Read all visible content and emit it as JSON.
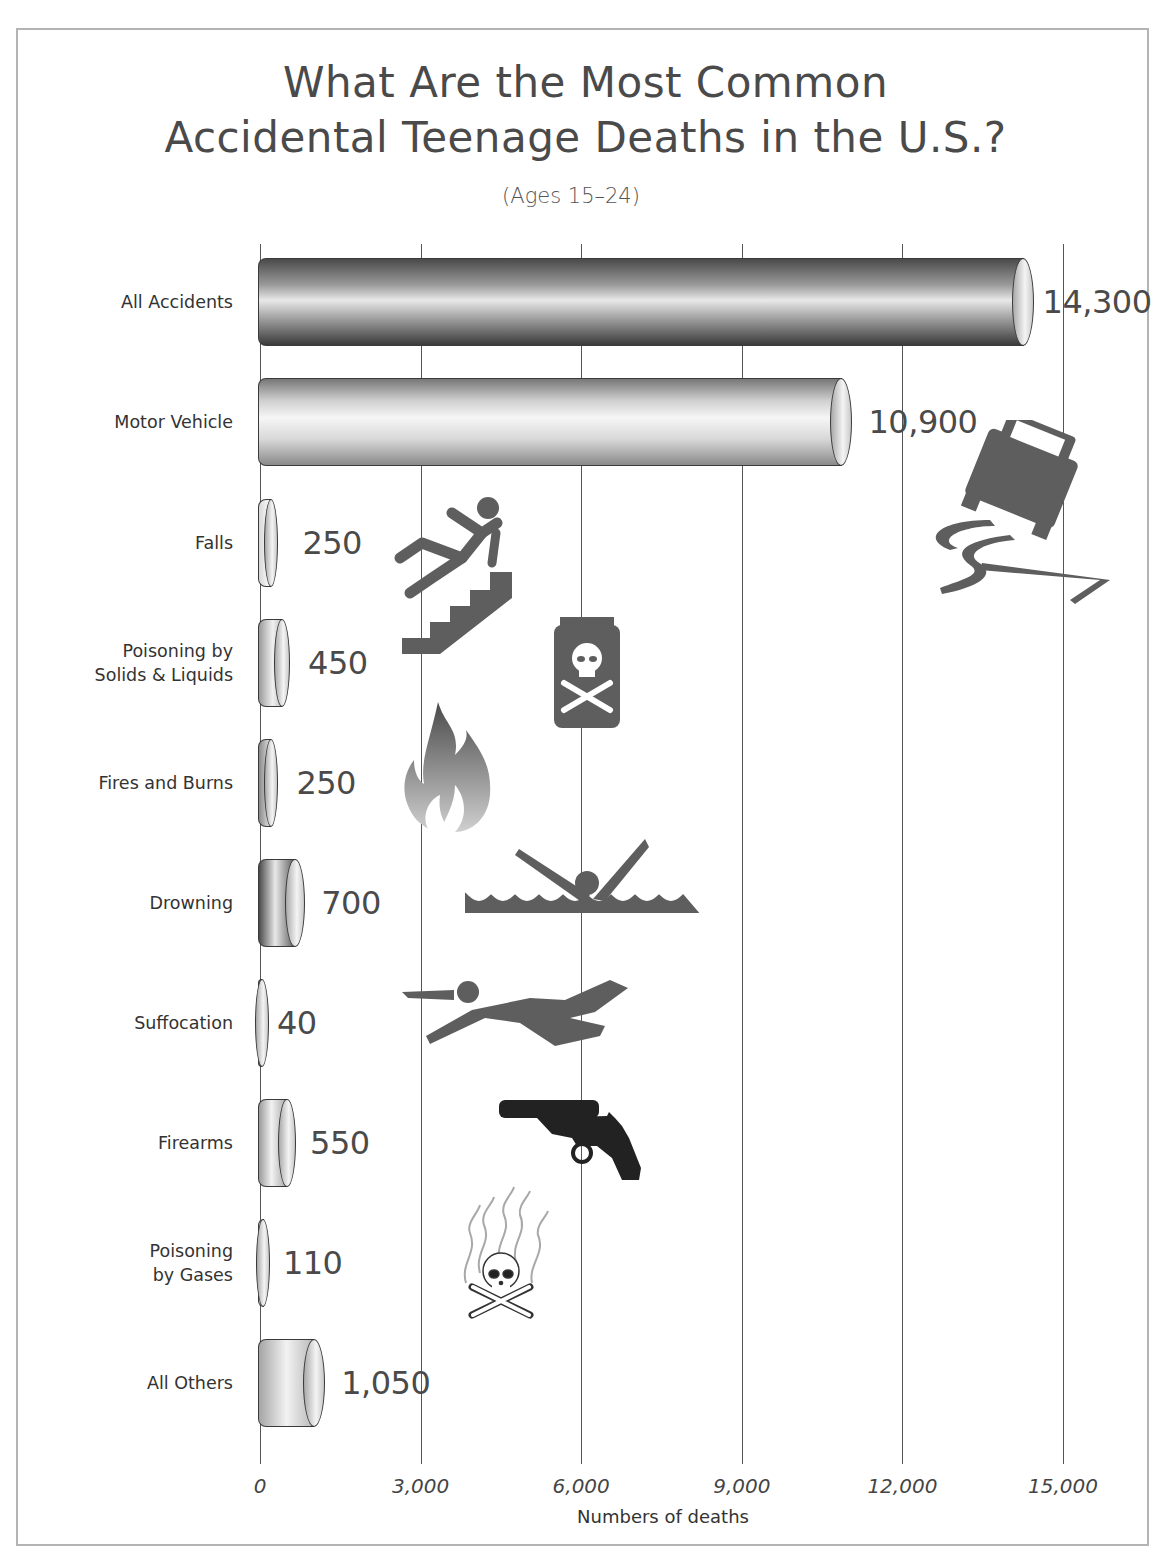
{
  "title_line1": "What Are the Most Common",
  "title_line2": "Accidental Teenage Deaths in the U.S.?",
  "subtitle": "(Ages 15–24)",
  "x_axis": {
    "label": "Numbers of deaths",
    "ticks": [
      "0",
      "3,000",
      "6,000",
      "9,000",
      "12,000",
      "15,000"
    ]
  },
  "categories": [
    {
      "label": "All Accidents",
      "value_label": "14,300",
      "icon": "none"
    },
    {
      "label": "Motor Vehicle",
      "value_label": "10,900",
      "icon": "skidding-car-icon"
    },
    {
      "label": "Falls",
      "value_label": "250",
      "icon": "falling-person-stairs-icon"
    },
    {
      "label": "Poisoning by\nSolids & Liquids",
      "value_label": "450",
      "icon": "poison-jar-icon"
    },
    {
      "label": "Fires and Burns",
      "value_label": "250",
      "icon": "flame-icon"
    },
    {
      "label": "Drowning",
      "value_label": "700",
      "icon": "drowning-person-icon"
    },
    {
      "label": "Suffocation",
      "value_label": "40",
      "icon": "suffocation-person-icon"
    },
    {
      "label": "Firearms",
      "value_label": "550",
      "icon": "revolver-icon"
    },
    {
      "label": "Poisoning\nby Gases",
      "value_label": "110",
      "icon": "skull-gas-icon"
    },
    {
      "label": "All Others",
      "value_label": "1,050",
      "icon": "none"
    }
  ],
  "colors": {
    "bar_dark": "#5a5a5a",
    "bar_light": "#f2f2f2",
    "icon": "#6a6a6a",
    "gun": "#222222",
    "grid": "#555555",
    "frame": "#b4b4b4"
  },
  "chart_data": {
    "type": "bar",
    "orientation": "horizontal",
    "subtitle": "(Ages 15–24)",
    "categories": [
      "All Accidents",
      "Motor Vehicle",
      "Falls",
      "Poisoning by Solids & Liquids",
      "Fires and Burns",
      "Drowning",
      "Suffocation",
      "Firearms",
      "Poisoning by Gases",
      "All Others"
    ],
    "values": [
      14300,
      10900,
      250,
      450,
      250,
      700,
      40,
      550,
      110,
      1050
    ],
    "xlabel": "Numbers of deaths",
    "ylabel": "",
    "xlim": [
      0,
      15000
    ],
    "xticks": [
      0,
      3000,
      6000,
      9000,
      12000,
      15000
    ],
    "grid": "vertical lines at ticks",
    "legend": "none",
    "data_labels": true,
    "style": "3D cylinder bars with pictogram icons"
  }
}
